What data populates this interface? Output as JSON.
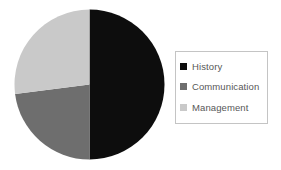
{
  "chart_data": {
    "type": "pie",
    "title": "",
    "subtitle": "",
    "xlabel": "",
    "ylabel": "",
    "grid": false,
    "legend_position": "right",
    "categories": [
      "History",
      "Communication",
      "Management"
    ],
    "values": [
      50,
      23,
      27
    ],
    "slices": [
      {
        "label": "History",
        "value": 50,
        "percent": 50,
        "color": "#0d0d0d",
        "start_angle": 0,
        "end_angle": 180
      },
      {
        "label": "Communication",
        "value": 23,
        "percent": 23,
        "color": "#6e6e6e",
        "start_angle": 180,
        "end_angle": 262.8
      },
      {
        "label": "Management",
        "value": 27,
        "percent": 27,
        "color": "#c9c9c9",
        "start_angle": 262.8,
        "end_angle": 360
      }
    ]
  },
  "legend": {
    "items": [
      {
        "label": "History",
        "color": "#0d0d0d"
      },
      {
        "label": "Communication",
        "color": "#6e6e6e"
      },
      {
        "label": "Management",
        "color": "#c9c9c9"
      }
    ]
  },
  "geometry": {
    "center_x": 75.5,
    "center_y": 75.5,
    "radius": 75
  },
  "colors": {
    "background": "#ffffff",
    "legend_border": "#c4c4c4",
    "legend_text": "#575757"
  }
}
